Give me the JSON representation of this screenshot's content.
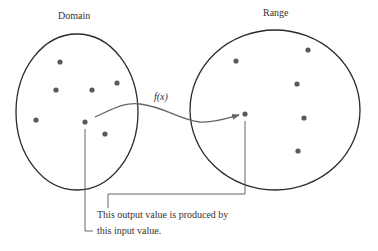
{
  "diagram": {
    "domain_label": "Domain",
    "range_label": "Range",
    "function_label": "f(x)",
    "annotation_output": "This output value is produced by",
    "annotation_input": "this input value.",
    "colors": {
      "outline": "#2a2a2a",
      "dot": "#5a5a5a",
      "arrow": "#666666",
      "leader": "#555555"
    },
    "domain_set": {
      "ellipse": {
        "cx": 77,
        "cy": 112,
        "rx": 61,
        "ry": 78
      },
      "points": [
        [
          60,
          62
        ],
        [
          56,
          90
        ],
        [
          92,
          90
        ],
        [
          117,
          83
        ],
        [
          36,
          120
        ],
        [
          85,
          122
        ],
        [
          105,
          134
        ]
      ],
      "highlighted_input": [
        85,
        122
      ]
    },
    "range_set": {
      "ellipse": {
        "cx": 275,
        "cy": 110,
        "rx": 85,
        "ry": 80
      },
      "points": [
        [
          236,
          61
        ],
        [
          308,
          50
        ],
        [
          297,
          84
        ],
        [
          304,
          118
        ],
        [
          298,
          151
        ],
        [
          245,
          114
        ]
      ],
      "highlighted_output": [
        245,
        114
      ]
    }
  }
}
